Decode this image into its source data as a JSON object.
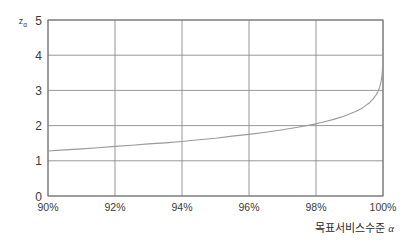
{
  "chart_data": {
    "type": "line",
    "title": "",
    "subtitle": "",
    "xlabel": "목표서비스수준 α",
    "ylabel": "z",
    "ylabel_subscript": "α",
    "xlim": [
      90,
      100
    ],
    "ylim": [
      0,
      5
    ],
    "grid": true,
    "legend": false,
    "legend_position": "none",
    "x_tick_labels": [
      "90%",
      "92%",
      "94%",
      "96%",
      "98%",
      "100%"
    ],
    "x_tick_values": [
      90,
      92,
      94,
      96,
      98,
      100
    ],
    "y_tick_labels": [
      "0",
      "1",
      "2",
      "3",
      "4",
      "5"
    ],
    "y_tick_values": [
      0,
      1,
      2,
      3,
      4,
      5
    ],
    "series": [
      {
        "name": "z_alpha",
        "x": [
          90,
          90.5,
          91,
          91.5,
          92,
          92.5,
          93,
          93.5,
          94,
          94.5,
          95,
          95.5,
          96,
          96.5,
          97,
          97.5,
          98,
          98.25,
          98.5,
          98.75,
          99,
          99.2,
          99.4,
          99.5,
          99.6,
          99.7,
          99.8,
          99.85,
          99.9,
          99.93,
          99.95,
          99.97,
          99.98,
          99.99,
          99.995,
          99.9997
        ],
        "values": [
          1.28,
          1.31,
          1.34,
          1.37,
          1.41,
          1.44,
          1.48,
          1.51,
          1.55,
          1.6,
          1.64,
          1.7,
          1.75,
          1.81,
          1.88,
          1.96,
          2.05,
          2.11,
          2.17,
          2.24,
          2.33,
          2.41,
          2.51,
          2.58,
          2.65,
          2.75,
          2.88,
          2.97,
          3.09,
          3.2,
          3.29,
          3.43,
          3.54,
          3.72,
          3.89,
          5.0
        ]
      }
    ],
    "annotations": [],
    "colors": {
      "curve": "#9a9a9a",
      "grid": "#8c8c8c",
      "axis": "#6f6f6f",
      "background": "#ffffff",
      "text": "#2b2b2b"
    }
  }
}
